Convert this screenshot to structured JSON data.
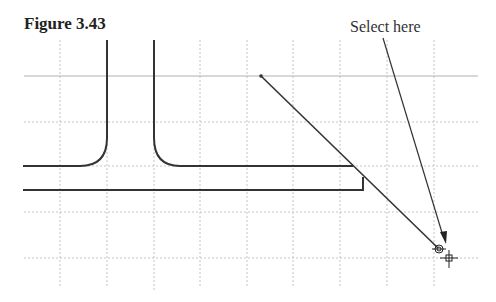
{
  "figure": {
    "title": "Figure 3.43",
    "callout_label": "Select here"
  },
  "grid": {
    "vertical_x": [
      60,
      107,
      154,
      200,
      247,
      293,
      340,
      387,
      434
    ],
    "horizontal_y": [
      76,
      122,
      166,
      212,
      258
    ],
    "color": "#b8b8b8"
  },
  "drawing": {
    "line_color": "#333333",
    "diagonal_line": {
      "x1": 261,
      "y1": 76,
      "x2": 438,
      "y2": 248
    },
    "leader_arrow": {
      "x1": 383,
      "y1": 38,
      "x2": 445,
      "y2": 245
    }
  }
}
